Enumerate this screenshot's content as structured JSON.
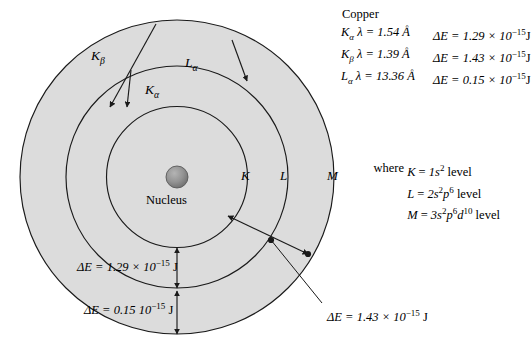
{
  "figure": {
    "element": "Copper",
    "nucleus_label": "Nucleus"
  },
  "emission_lines": {
    "title": "Copper",
    "rows": [
      {
        "line": "K",
        "line_sub": "α",
        "lambda_text": "λ = 1.54 Å",
        "energy_text": "ΔE = 1.29 × 10",
        "energy_exp": "−15",
        "energy_unit": "J"
      },
      {
        "line": "K",
        "line_sub": "β",
        "lambda_text": "λ = 1.39 Å",
        "energy_text": "ΔE = 1.43 × 10",
        "energy_exp": "−15",
        "energy_unit": "J"
      },
      {
        "line": "L",
        "line_sub": "α",
        "lambda_text": "λ = 13.36 Å",
        "energy_text": "ΔE = 0.15 × 10",
        "energy_exp": "−15",
        "energy_unit": "J"
      }
    ]
  },
  "levels": {
    "where_label": "where",
    "rows": [
      {
        "shell": "K",
        "eq": "=",
        "config_a": "1s",
        "config_a_sup": "2",
        "config_b": "",
        "config_b_sup": "",
        "config_c": "",
        "config_c_sup": "",
        "suffix": "level"
      },
      {
        "shell": "L",
        "eq": "=",
        "config_a": "2s",
        "config_a_sup": "2",
        "config_b": "p",
        "config_b_sup": "6",
        "config_c": "",
        "config_c_sup": "",
        "suffix": "level"
      },
      {
        "shell": "M",
        "eq": "=",
        "config_a": "3s",
        "config_a_sup": "2",
        "config_b": "p",
        "config_b_sup": "6",
        "config_c": "d",
        "config_c_sup": "10",
        "suffix": "level"
      }
    ]
  },
  "shells": {
    "k_label": "K",
    "l_label": "L",
    "m_label": "M"
  },
  "transitions": {
    "k_beta": {
      "letter": "K",
      "sub": "β"
    },
    "k_alpha": {
      "letter": "K",
      "sub": "α"
    },
    "l_alpha": {
      "letter": "L",
      "sub": "α"
    }
  },
  "energy_gaps": {
    "k_to_l": {
      "prefix": "ΔE = 1.29 × 10",
      "exp": "−15",
      "unit": "J"
    },
    "l_to_m": {
      "prefix": "ΔE = 0.15  10",
      "exp": "−15",
      "unit": "J"
    },
    "k_to_m": {
      "prefix": "ΔE = 1.43 × 10",
      "exp": "−15",
      "unit": "J"
    }
  },
  "colors": {
    "shell_fill": "#dcdcdc",
    "stroke": "#1a1a1a",
    "nucleus": "#8c8c8c",
    "background": "#ffffff"
  }
}
